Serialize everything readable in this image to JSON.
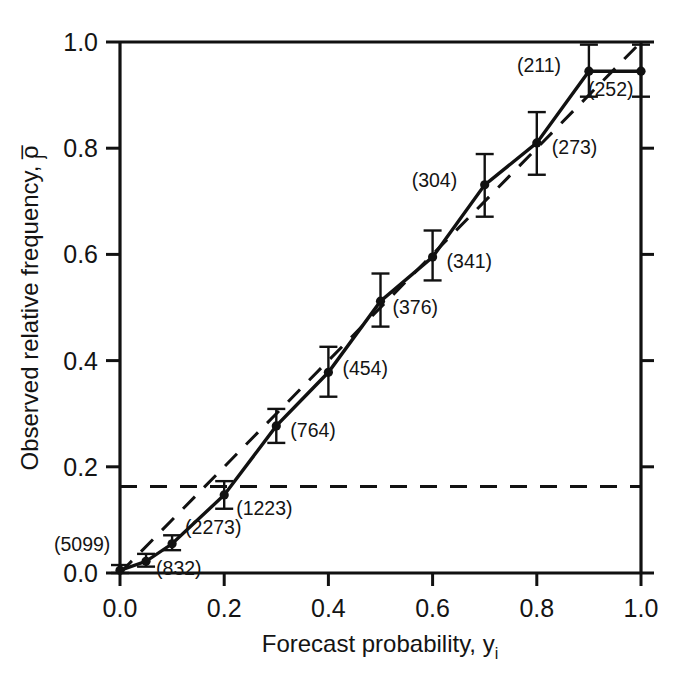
{
  "chart_data": {
    "type": "line",
    "title": "",
    "xlabel": "Forecast probability, y",
    "xlabel_sub": "i",
    "ylabel": "Observed relative frequency, o",
    "ylabel_sub": "j",
    "ylabel_overbar": true,
    "xlim": [
      0.0,
      1.0
    ],
    "ylim": [
      0.0,
      1.0
    ],
    "xticks": [
      "0.0",
      "0.2",
      "0.4",
      "0.6",
      "0.8",
      "1.0"
    ],
    "xtick_values": [
      0.0,
      0.2,
      0.4,
      0.6,
      0.8,
      1.0
    ],
    "yticks": [
      "0.0",
      "0.2",
      "0.4",
      "0.6",
      "0.8",
      "1.0"
    ],
    "ytick_values": [
      0.0,
      0.2,
      0.4,
      0.6,
      0.8,
      1.0
    ],
    "grid": false,
    "legend": "none",
    "series": [
      {
        "name": "Reliability curve",
        "style": "solid-with-markers-and-error-bars",
        "x": [
          0.0,
          0.05,
          0.1,
          0.2,
          0.3,
          0.4,
          0.5,
          0.6,
          0.7,
          0.8,
          0.9,
          1.0
        ],
        "y": [
          0.005,
          0.022,
          0.055,
          0.147,
          0.277,
          0.378,
          0.512,
          0.595,
          0.731,
          0.81,
          0.945,
          0.945
        ],
        "err_low": [
          0.005,
          0.01,
          0.012,
          0.026,
          0.032,
          0.046,
          0.048,
          0.044,
          0.06,
          0.06,
          0.048,
          0.048
        ],
        "err_high": [
          0.01,
          0.014,
          0.016,
          0.026,
          0.032,
          0.048,
          0.052,
          0.05,
          0.058,
          0.058,
          0.05,
          0.05
        ],
        "counts": [
          "(5099)",
          "(832)",
          "(2273)",
          "(1223)",
          "(764)",
          "(454)",
          "(376)",
          "(341)",
          "(304)",
          "(273)",
          "(211)",
          "(252)"
        ]
      },
      {
        "name": "Perfect reliability reference",
        "style": "dashed-diagonal",
        "x": [
          0.0,
          1.0
        ],
        "y": [
          0.0,
          1.0
        ],
        "note": "dashed line from origin rising steeper than the observed curve, reaching the upper right corner"
      },
      {
        "name": "Climatological base rate",
        "style": "dashed-horizontal",
        "y_value": 0.163,
        "note": "horizontal dashed line spanning the full x range"
      }
    ],
    "annotations": [
      {
        "label": "(5099)",
        "x": 0.0,
        "y": 0.005,
        "anchor": "left-above"
      },
      {
        "label": "(832)",
        "x": 0.05,
        "y": 0.022,
        "anchor": "right"
      },
      {
        "label": "(2273)",
        "x": 0.1,
        "y": 0.055,
        "anchor": "right"
      },
      {
        "label": "(1223)",
        "x": 0.2,
        "y": 0.147,
        "anchor": "right-below"
      },
      {
        "label": "(764)",
        "x": 0.3,
        "y": 0.277,
        "anchor": "right"
      },
      {
        "label": "(454)",
        "x": 0.4,
        "y": 0.378,
        "anchor": "right"
      },
      {
        "label": "(376)",
        "x": 0.5,
        "y": 0.512,
        "anchor": "right"
      },
      {
        "label": "(341)",
        "x": 0.6,
        "y": 0.595,
        "anchor": "right"
      },
      {
        "label": "(304)",
        "x": 0.7,
        "y": 0.731,
        "anchor": "left"
      },
      {
        "label": "(273)",
        "x": 0.8,
        "y": 0.81,
        "anchor": "right"
      },
      {
        "label": "(211)",
        "x": 0.9,
        "y": 0.945,
        "anchor": "left"
      },
      {
        "label": "(252)",
        "x": 1.0,
        "y": 0.945,
        "anchor": "left-below"
      }
    ],
    "colors": {
      "line": "#111111",
      "axis": "#111111",
      "text": "#141414",
      "background": "#ffffff"
    }
  }
}
